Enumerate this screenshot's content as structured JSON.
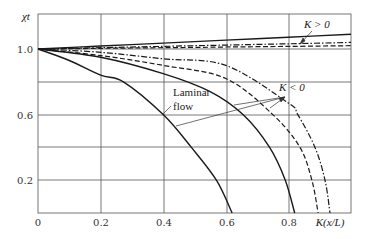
{
  "chart_data": {
    "type": "line",
    "title": "",
    "xlabel": "K(x/L)",
    "ylabel": "χt",
    "xlim": [
      0,
      1.0
    ],
    "ylim": [
      0,
      1.2
    ],
    "grid": true,
    "x_ticks": [
      "0",
      "0.2",
      "0.4",
      "0.6",
      "0.8"
    ],
    "y_ticks": [
      "0.2",
      "0.6",
      "1.0"
    ],
    "annotations": {
      "k_positive": "K > 0",
      "k_negative": "K < 0",
      "laminar_line1": "Laminar",
      "laminar_line2": "flow"
    },
    "series": [
      {
        "name": "K>0 solid",
        "style": "solid",
        "x": [
          0,
          0.2,
          0.4,
          0.6,
          0.8,
          1.0
        ],
        "y": [
          1.0,
          1.018,
          1.036,
          1.054,
          1.072,
          1.09
        ]
      },
      {
        "name": "K>0 dash-dot",
        "style": "dashdot",
        "x": [
          0,
          0.2,
          0.4,
          0.6,
          0.8,
          1.0
        ],
        "y": [
          1.0,
          1.008,
          1.016,
          1.024,
          1.032,
          1.04
        ]
      },
      {
        "name": "K>0 dashed",
        "style": "dashed",
        "x": [
          0,
          0.2,
          0.4,
          0.6,
          0.8,
          1.0
        ],
        "y": [
          1.0,
          1.004,
          1.008,
          1.012,
          1.016,
          1.02
        ]
      },
      {
        "name": "Laminar flow",
        "style": "solid",
        "x": [
          0,
          0.1,
          0.2,
          0.273,
          0.4,
          0.49,
          0.57,
          0.62
        ],
        "y": [
          1.0,
          0.93,
          0.84,
          0.8,
          0.6,
          0.4,
          0.2,
          0.0
        ]
      },
      {
        "name": "K<0 solid",
        "style": "solid",
        "x": [
          0,
          0.2,
          0.4,
          0.55,
          0.655,
          0.74,
          0.79,
          0.82
        ],
        "y": [
          1.0,
          0.95,
          0.85,
          0.74,
          0.6,
          0.4,
          0.2,
          0.0
        ]
      },
      {
        "name": "K<0 dashed",
        "style": "dashed",
        "x": [
          0,
          0.2,
          0.4,
          0.6,
          0.75,
          0.837,
          0.875,
          0.895
        ],
        "y": [
          1.0,
          0.96,
          0.9,
          0.82,
          0.6,
          0.4,
          0.2,
          0.0
        ]
      },
      {
        "name": "K<0 dash-dot",
        "style": "dashdot",
        "x": [
          0,
          0.2,
          0.4,
          0.6,
          0.8,
          0.83,
          0.885,
          0.917,
          0.933
        ],
        "y": [
          1.0,
          0.98,
          0.94,
          0.9,
          0.67,
          0.6,
          0.4,
          0.2,
          0.0
        ]
      }
    ]
  }
}
